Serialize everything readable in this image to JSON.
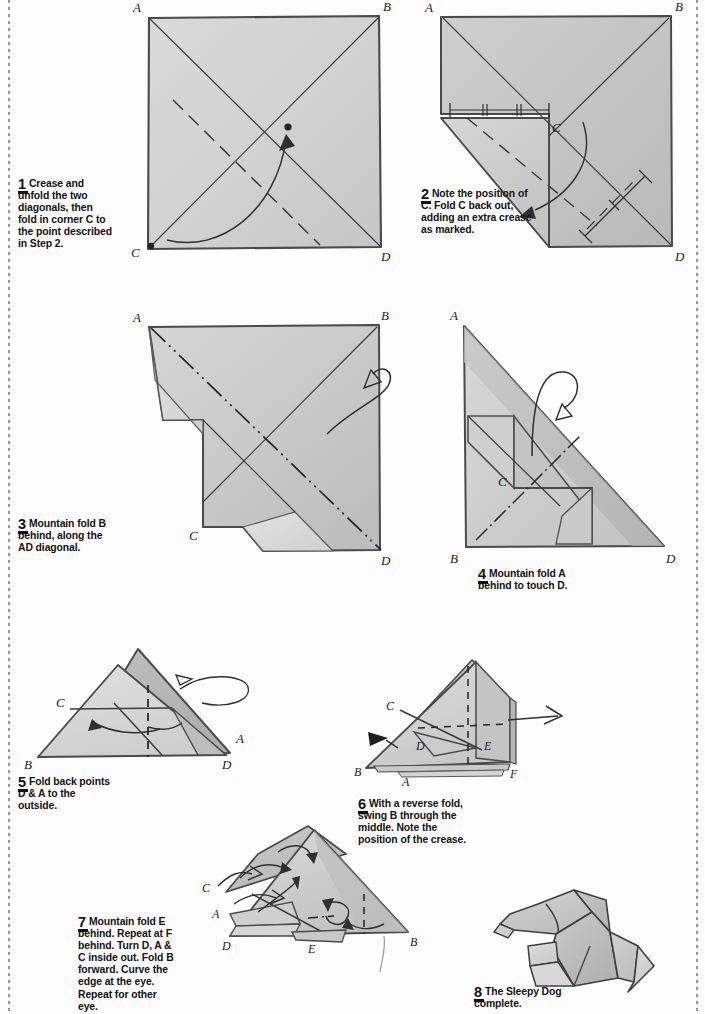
{
  "page": {
    "background": "#fdfdfd",
    "paper_fill_light": "#dcdcdc",
    "paper_fill_mid": "#c8c8c8",
    "paper_fill_dark": "#b4b4b4",
    "ink": "#1d1d1d"
  },
  "steps": [
    {
      "number": "1",
      "text": "Crease and unfold the two diagonals, then fold in corner C to the point described in Step 2.",
      "labels": [
        "A",
        "B",
        "C",
        "D"
      ]
    },
    {
      "number": "2",
      "text": "Note the position of C. Fold C back out, adding an extra crease as marked.",
      "labels": [
        "A",
        "B",
        "C",
        "D"
      ]
    },
    {
      "number": "3",
      "text": "Mountain fold B behind, along the AD diagonal.",
      "labels": [
        "A",
        "B",
        "C",
        "D"
      ]
    },
    {
      "number": "4",
      "text": "Mountain fold A behind to touch D.",
      "labels": [
        "A",
        "B",
        "C",
        "D"
      ]
    },
    {
      "number": "5",
      "text": "Fold back points D & A to the outside.",
      "labels": [
        "A",
        "B",
        "C",
        "D"
      ]
    },
    {
      "number": "6",
      "text": "With a reverse fold, swing B through the middle. Note the position of the crease.",
      "labels": [
        "A",
        "B",
        "C",
        "D",
        "E",
        "F"
      ]
    },
    {
      "number": "7",
      "text": "Mountain fold E behind. Repeat at F behind. Turn D, A & C inside out. Fold B forward. Curve the edge at the eye. Repeat for other eye.",
      "labels": [
        "A",
        "B",
        "C",
        "D",
        "E"
      ]
    },
    {
      "number": "8",
      "text": "The Sleepy Dog complete.",
      "labels": []
    }
  ],
  "figure_labels": {
    "s1": {
      "A": "A",
      "B": "B",
      "C": "C",
      "D": "D"
    },
    "s2": {
      "A": "A",
      "B": "B",
      "C": "C",
      "D": "D"
    },
    "s3": {
      "A": "A",
      "B": "B",
      "C": "C",
      "D": "D"
    },
    "s4": {
      "A": "A",
      "B": "B",
      "C": "C",
      "D": "D"
    },
    "s5": {
      "A": "A",
      "B": "B",
      "C": "C",
      "D": "D"
    },
    "s6": {
      "A": "A",
      "B": "B",
      "C": "C",
      "D": "D",
      "E": "E",
      "F": "F"
    },
    "s7": {
      "A": "A",
      "B": "B",
      "C": "C",
      "D": "D",
      "E": "E"
    }
  }
}
